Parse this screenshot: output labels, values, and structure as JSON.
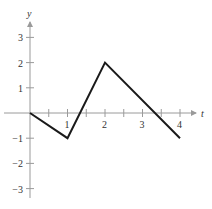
{
  "chart_data": {
    "type": "line",
    "title": "",
    "xlabel": "t",
    "ylabel": "y",
    "x": [
      0,
      1,
      2,
      4
    ],
    "series": [
      {
        "name": "f(t)",
        "values": [
          0,
          -1,
          2,
          -1
        ]
      }
    ],
    "xlim": [
      0,
      4
    ],
    "ylim": [
      -3,
      3
    ],
    "x_ticks": [
      1,
      2,
      3,
      4
    ],
    "x_minor_ticks": [
      0.5,
      1.5,
      2.5,
      3.5
    ],
    "y_ticks": [
      -3,
      -2,
      -1,
      1,
      2,
      3
    ],
    "grid": false,
    "legend": "none"
  },
  "axes": {
    "x_label": "t",
    "y_label": "y",
    "x_tick_labels": [
      "1",
      "2",
      "3",
      "4"
    ],
    "y_tick_labels": [
      "3",
      "2",
      "1",
      "−1",
      "−2",
      "−3"
    ]
  },
  "colors": {
    "axis": "#9a9a9a",
    "line": "#1a1a1a",
    "text": "#333333"
  }
}
